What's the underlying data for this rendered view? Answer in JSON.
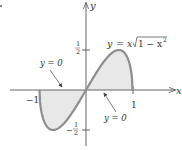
{
  "chart_data": {
    "type": "area",
    "title": "",
    "function_label": "y = x√(1 − x²)",
    "xlabel": "x",
    "ylabel": "y",
    "xlim": [
      -1.1,
      1.15
    ],
    "ylim": [
      -0.7,
      1.1
    ],
    "grid": false,
    "x_ticks": [
      {
        "value": -1,
        "label": "−1"
      },
      {
        "value": 1,
        "label": "1"
      }
    ],
    "y_ticks": [
      {
        "value": 0.5,
        "label": "1/2"
      },
      {
        "value": -0.5,
        "label": "−1/2"
      }
    ],
    "series": [
      {
        "name": "y = x√(1 − x²)",
        "x": [
          -1,
          -0.9,
          -0.8,
          -0.707,
          -0.6,
          -0.4,
          -0.2,
          0,
          0.2,
          0.4,
          0.6,
          0.707,
          0.8,
          0.9,
          1
        ],
        "values": [
          0,
          -0.392,
          -0.48,
          -0.5,
          -0.48,
          -0.367,
          -0.196,
          0,
          0.196,
          0.367,
          0.48,
          0.5,
          0.48,
          0.392,
          0
        ]
      }
    ],
    "shaded_regions": [
      {
        "from": -1,
        "to": 0,
        "fill": "#e6e6e6"
      },
      {
        "from": 0,
        "to": 1,
        "fill": "#e6e6e6"
      }
    ],
    "annotations": [
      {
        "text": "y = 0",
        "points_to": "x-axis segment on left"
      },
      {
        "text": "y = 0",
        "points_to": "x-axis segment on right"
      }
    ],
    "colors": {
      "curve": "#8c8c8c",
      "fill": "#e6e6e6",
      "axis": "#555555"
    }
  },
  "labels": {
    "x_axis": "x",
    "y_axis": "y",
    "func_y": "y",
    "func_eq": "=",
    "func_x": "x",
    "func_rad": "1 − x",
    "func_sup": "2",
    "tick_half_num": "1",
    "tick_half_den": "2",
    "tick_neghalf_minus": "−",
    "tick_neghalf_num": "1",
    "tick_neghalf_den": "2",
    "tick_neg1": "−1",
    "tick_1": "1",
    "ann_left": "y = 0",
    "ann_right": "y = 0"
  }
}
